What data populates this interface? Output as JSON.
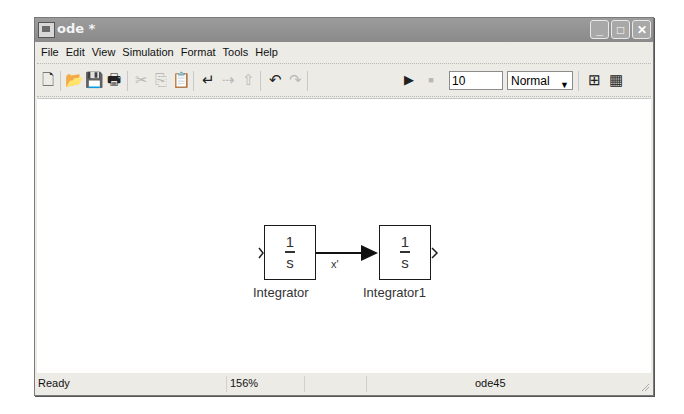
{
  "window": {
    "title": "ode *",
    "controls": {
      "minimize": "_",
      "maximize": "□",
      "close": "✕"
    }
  },
  "menubar": {
    "items": [
      {
        "label": "File"
      },
      {
        "label": "Edit"
      },
      {
        "label": "View"
      },
      {
        "label": "Simulation"
      },
      {
        "label": "Format"
      },
      {
        "label": "Tools"
      },
      {
        "label": "Help"
      }
    ]
  },
  "toolbar": {
    "icons": {
      "new": "🗋",
      "open": "📂",
      "save": "💾",
      "print": "🖶",
      "cut": "✂",
      "copy": "⎘",
      "paste": "📋",
      "undo_arrow": "↵",
      "redo_arrow": "⇢",
      "up": "⇧",
      "undo": "↶",
      "redo": "↷",
      "start": "▶",
      "stop": "■",
      "model_browser": "⊞",
      "library": "▦"
    },
    "stop_time": "10",
    "sim_mode": "Normal",
    "sim_mode_arrow": "▼"
  },
  "diagram": {
    "blocks": [
      {
        "name": "Integrator",
        "numerator": "1",
        "denominator": "s"
      },
      {
        "name": "Integrator1",
        "numerator": "1",
        "denominator": "s"
      }
    ],
    "signal_label": "x'"
  },
  "statusbar": {
    "status": "Ready",
    "zoom": "156%",
    "solver": "ode45"
  }
}
